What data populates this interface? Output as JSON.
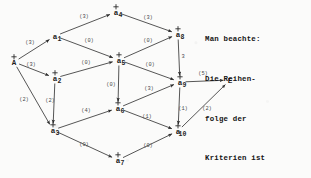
{
  "diagram": {
    "type": "directed-activity-network",
    "title_note": {
      "lines": [
        "Man beachte:",
        "Die Reihen-",
        "folge der",
        "Kriterien ist",
        "wichtig !"
      ],
      "full_text": "Man beachte: Die Reihenfolge der Kriterien ist wichtig !"
    },
    "nodes": [
      {
        "id": "A",
        "label": "A",
        "sub": "",
        "x": 14,
        "y": 62,
        "marker": "+"
      },
      {
        "id": "a1",
        "label": "a",
        "sub": "1",
        "x": 55,
        "y": 36,
        "marker": ""
      },
      {
        "id": "a2",
        "label": "a",
        "sub": "2",
        "x": 55,
        "y": 78,
        "marker": "+"
      },
      {
        "id": "a3",
        "label": "a",
        "sub": "3",
        "x": 53,
        "y": 130,
        "marker": "+"
      },
      {
        "id": "a4",
        "label": "a",
        "sub": "4",
        "x": 116,
        "y": 12,
        "marker": "+"
      },
      {
        "id": "a5",
        "label": "a",
        "sub": "5",
        "x": 119,
        "y": 60,
        "marker": "+"
      },
      {
        "id": "a6",
        "label": "a",
        "sub": "6",
        "x": 118,
        "y": 108,
        "marker": "+"
      },
      {
        "id": "a7",
        "label": "a",
        "sub": "7",
        "x": 118,
        "y": 160,
        "marker": "+"
      },
      {
        "id": "a8",
        "label": "a",
        "sub": "8",
        "x": 178,
        "y": 34,
        "marker": "+"
      },
      {
        "id": "a9",
        "label": "a",
        "sub": "9",
        "x": 180,
        "y": 82,
        "marker": "+"
      },
      {
        "id": "a10",
        "label": "a",
        "sub": "10",
        "x": 178,
        "y": 131,
        "marker": "+"
      },
      {
        "id": "E",
        "label": "E",
        "sub": "",
        "x": 230,
        "y": 80,
        "marker": ""
      }
    ],
    "edges": [
      {
        "from": "A",
        "to": "a1",
        "weight": "3",
        "label": "(3)",
        "lx": 30,
        "ly": 44
      },
      {
        "from": "A",
        "to": "a2",
        "weight": "3",
        "label": "(3)",
        "lx": 31,
        "ly": 66
      },
      {
        "from": "A",
        "to": "a3",
        "weight": "2",
        "label": "(2)",
        "lx": 24,
        "ly": 101
      },
      {
        "from": "a1",
        "to": "a4",
        "weight": "3",
        "label": "(3)",
        "lx": 84,
        "ly": 18
      },
      {
        "from": "a1",
        "to": "a5",
        "weight": "0",
        "label": "(0)",
        "lx": 89,
        "ly": 42
      },
      {
        "from": "a2",
        "to": "a5",
        "weight": "0",
        "label": "(0)",
        "lx": 86,
        "ly": 64
      },
      {
        "from": "a2",
        "to": "a3",
        "weight": "2",
        "label": "(2)",
        "lx": 50,
        "ly": 102
      },
      {
        "from": "a4",
        "to": "a8",
        "weight": "3",
        "label": "(3)",
        "lx": 148,
        "ly": 19
      },
      {
        "from": "a5",
        "to": "a8",
        "weight": "0",
        "label": "(0)",
        "lx": 148,
        "ly": 42
      },
      {
        "from": "a5",
        "to": "a9",
        "weight": "0",
        "label": "(0)",
        "lx": 150,
        "ly": 66
      },
      {
        "from": "a5",
        "to": "a6",
        "weight": "0",
        "label": "(0)",
        "lx": 111,
        "ly": 86
      },
      {
        "from": "a3",
        "to": "a6",
        "weight": "4",
        "label": "(4)",
        "lx": 86,
        "ly": 112
      },
      {
        "from": "a3",
        "to": "a7",
        "weight": "0",
        "label": "(0)",
        "lx": 84,
        "ly": 146
      },
      {
        "from": "a6",
        "to": "a9",
        "weight": "3",
        "label": "(3)",
        "lx": 149,
        "ly": 90
      },
      {
        "from": "a6",
        "to": "a10",
        "weight": "1",
        "label": "(1)",
        "lx": 147,
        "ly": 118
      },
      {
        "from": "a7",
        "to": "a10",
        "weight": "0",
        "label": "(0)",
        "lx": 148,
        "ly": 147
      },
      {
        "from": "a8",
        "to": "a9",
        "weight": "3",
        "label": "3",
        "lx": 183,
        "ly": 58
      },
      {
        "from": "a9",
        "to": "a10",
        "weight": "1",
        "label": "(1)",
        "lx": 183,
        "ly": 110
      },
      {
        "from": "a9",
        "to": "E",
        "weight": "5",
        "label": "(5)",
        "lx": 203,
        "ly": 75
      },
      {
        "from": "a10",
        "to": "E",
        "weight": "2",
        "label": "(2)",
        "lx": 207,
        "ly": 110
      }
    ],
    "colors": {
      "ink": "#2b2b2b",
      "label_ink": "#4a4a4a",
      "note_ink": "#141414",
      "paper": "#fbfbfa"
    }
  }
}
